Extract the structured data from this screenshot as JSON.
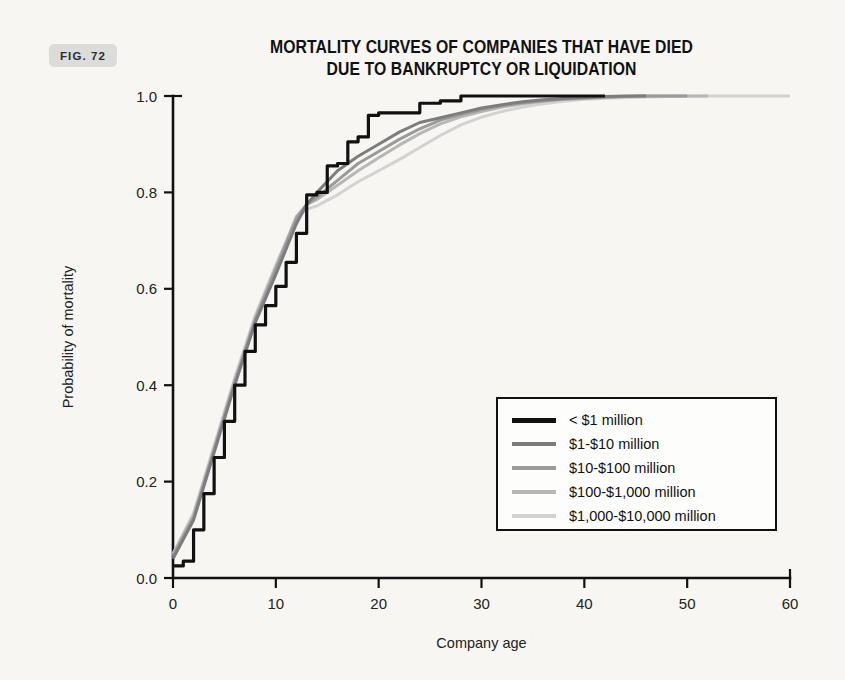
{
  "figure": {
    "badge_label": "FIG. 72"
  },
  "chart_data": {
    "type": "line",
    "title": "MORTALITY CURVES OF COMPANIES THAT HAVE DIED DUE TO BANKRUPTCY OR LIQUIDATION",
    "title_line1": "MORTALITY CURVES OF COMPANIES THAT HAVE DIED",
    "title_line2": "DUE TO BANKRUPTCY OR LIQUIDATION",
    "xlabel": "Company age",
    "ylabel": "Probability of mortality",
    "xlim": [
      0,
      60
    ],
    "ylim": [
      0.0,
      1.0
    ],
    "xticks": [
      0,
      10,
      20,
      30,
      40,
      50,
      60
    ],
    "xticklabels": [
      "0",
      "10",
      "20",
      "30",
      "40",
      "50",
      "60"
    ],
    "yticks": [
      0.0,
      0.2,
      0.4,
      0.6,
      0.8,
      1.0
    ],
    "yticklabels": [
      "0.0",
      "0.2",
      "0.4",
      "0.6",
      "0.8",
      "1.0"
    ],
    "grid": false,
    "legend_position": "center-right",
    "series": [
      {
        "name": "< $1 million",
        "color": "#111111",
        "linewidth": 3.2,
        "step": true,
        "x": [
          0,
          1,
          2,
          3,
          4,
          5,
          6,
          7,
          8,
          9,
          10,
          11,
          12,
          13,
          14,
          15,
          16,
          17,
          18,
          19,
          20,
          22,
          24,
          26,
          28,
          30,
          32,
          34,
          36,
          38,
          40,
          42
        ],
        "y": [
          0.025,
          0.035,
          0.1,
          0.175,
          0.25,
          0.325,
          0.4,
          0.47,
          0.525,
          0.565,
          0.605,
          0.655,
          0.715,
          0.795,
          0.8,
          0.855,
          0.86,
          0.905,
          0.915,
          0.96,
          0.965,
          0.965,
          0.985,
          0.99,
          1.0,
          1.0,
          1.0,
          1.0,
          1.0,
          1.0,
          1.0,
          1.0
        ]
      },
      {
        "name": "$1-$10 million",
        "color": "#7d7d7d",
        "linewidth": 3.0,
        "step": false,
        "x": [
          0,
          2,
          4,
          6,
          8,
          10,
          12,
          13,
          14,
          16,
          18,
          20,
          22,
          24,
          26,
          28,
          30,
          32,
          34,
          36,
          38,
          40,
          42,
          44,
          46
        ],
        "y": [
          0.04,
          0.12,
          0.26,
          0.4,
          0.53,
          0.63,
          0.735,
          0.775,
          0.8,
          0.845,
          0.875,
          0.9,
          0.925,
          0.945,
          0.955,
          0.965,
          0.975,
          0.982,
          0.988,
          0.992,
          0.995,
          0.997,
          0.999,
          1.0,
          1.0
        ]
      },
      {
        "name": "$10-$100 million",
        "color": "#9a9a9a",
        "linewidth": 3.0,
        "step": false,
        "x": [
          0,
          2,
          4,
          6,
          8,
          10,
          12,
          13,
          14,
          16,
          18,
          20,
          22,
          24,
          26,
          28,
          30,
          32,
          34,
          36,
          38,
          40,
          42,
          44,
          46,
          48,
          50
        ],
        "y": [
          0.045,
          0.125,
          0.265,
          0.405,
          0.535,
          0.64,
          0.745,
          0.775,
          0.79,
          0.825,
          0.86,
          0.885,
          0.91,
          0.932,
          0.95,
          0.962,
          0.972,
          0.98,
          0.986,
          0.99,
          0.994,
          0.996,
          0.998,
          0.999,
          1.0,
          1.0,
          1.0
        ]
      },
      {
        "name": "$100-$1,000 million",
        "color": "#b7b7b7",
        "linewidth": 3.0,
        "step": false,
        "x": [
          0,
          2,
          4,
          6,
          8,
          10,
          12,
          13,
          14,
          16,
          18,
          20,
          22,
          24,
          26,
          28,
          30,
          32,
          34,
          36,
          38,
          40,
          42,
          44,
          46,
          48,
          50,
          52
        ],
        "y": [
          0.05,
          0.13,
          0.27,
          0.41,
          0.54,
          0.645,
          0.75,
          0.775,
          0.785,
          0.815,
          0.845,
          0.872,
          0.898,
          0.922,
          0.942,
          0.957,
          0.968,
          0.977,
          0.984,
          0.989,
          0.993,
          0.995,
          0.997,
          0.999,
          1.0,
          1.0,
          1.0,
          1.0
        ]
      },
      {
        "name": "$1,000-$10,000 million",
        "color": "#d2d2d2",
        "linewidth": 3.0,
        "step": false,
        "x": [
          0,
          2,
          4,
          6,
          8,
          10,
          12,
          13,
          14,
          16,
          18,
          20,
          22,
          24,
          26,
          28,
          30,
          32,
          34,
          36,
          38,
          40,
          44,
          48,
          52,
          56,
          60
        ],
        "y": [
          0.05,
          0.135,
          0.275,
          0.415,
          0.545,
          0.65,
          0.745,
          0.765,
          0.772,
          0.795,
          0.822,
          0.845,
          0.868,
          0.893,
          0.918,
          0.94,
          0.956,
          0.968,
          0.977,
          0.984,
          0.989,
          0.993,
          0.997,
          0.999,
          1.0,
          1.0,
          1.0
        ]
      }
    ]
  }
}
